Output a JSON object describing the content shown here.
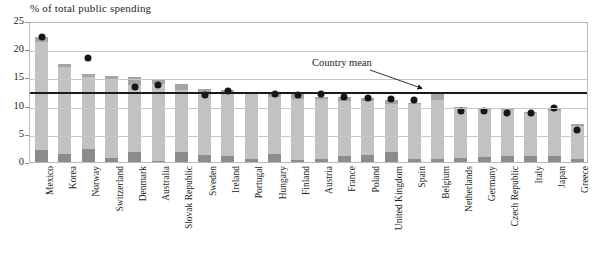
{
  "chart_data": {
    "type": "bar",
    "title": "% of total public spending",
    "xlabel": "",
    "ylabel": "% of total public spending",
    "ylim": [
      0,
      25
    ],
    "yticks": [
      0,
      5,
      10,
      15,
      20,
      25
    ],
    "grid": true,
    "legend_position": "none",
    "stacked": true,
    "categories": [
      "Mexico",
      "Korea",
      "Norway",
      "Switzerland",
      "Denmark",
      "Australia",
      "Slovak Republic",
      "Sweden",
      "Ireland",
      "Portugal",
      "Hungary",
      "Finland",
      "Austria",
      "France",
      "Poland",
      "United Kingdom",
      "Spain",
      "Belgium",
      "Netherlands",
      "Germany",
      "Czech Republic",
      "Italy",
      "Japan",
      "Greece"
    ],
    "series": [
      {
        "name": "lower segment",
        "values": [
          2.2,
          1.4,
          2.3,
          0.7,
          1.7,
          0.2,
          1.7,
          1.2,
          1.0,
          0.5,
          1.5,
          0.3,
          0.6,
          1.0,
          1.3,
          1.7,
          0.6,
          0.5,
          0.8,
          0.9,
          1.0,
          1.0,
          1.1,
          0.5
        ]
      },
      {
        "name": "middle segment",
        "values": [
          19.0,
          15.4,
          12.7,
          13.8,
          11.9,
          13.6,
          11.1,
          11.1,
          11.3,
          11.5,
          10.0,
          10.9,
          10.6,
          9.9,
          9.6,
          8.6,
          9.6,
          10.5,
          8.8,
          8.4,
          8.2,
          7.7,
          7.9,
          5.9
        ]
      },
      {
        "name": "upper segment",
        "values": [
          1.0,
          0.6,
          0.6,
          0.7,
          1.4,
          1.0,
          1.0,
          0.6,
          0.5,
          0.4,
          0.7,
          1.0,
          0.4,
          0.6,
          0.4,
          0.7,
          0.3,
          1.0,
          0.2,
          0.3,
          0.2,
          0.2,
          0.5,
          0.3
        ]
      }
    ],
    "totals": [
      22.2,
      17.4,
      15.6,
      15.2,
      15.0,
      14.8,
      13.8,
      12.9,
      12.8,
      12.4,
      12.2,
      12.2,
      11.6,
      11.5,
      11.3,
      11.0,
      10.5,
      12.0,
      9.8,
      9.6,
      9.4,
      8.9,
      9.5,
      6.7
    ],
    "markers": {
      "name": "country point",
      "values": [
        22.2,
        null,
        18.4,
        null,
        13.3,
        13.6,
        null,
        11.8,
        12.6,
        null,
        12.1,
        11.8,
        12.1,
        11.5,
        11.3,
        11.1,
        11.0,
        null,
        9.1,
        9.0,
        8.7,
        8.7,
        9.5,
        5.6
      ]
    },
    "reference_line": {
      "label": "Country mean",
      "value": 12.7
    }
  },
  "colors": {
    "segment_bottom": "#8c8c8c",
    "segment_middle": "#c2c2c2",
    "segment_top": "#a5a5a5",
    "marker": "#161616",
    "mean_line": "#1a1a1a",
    "gridline": "#c7c7c7",
    "frame": "#b9b9b9",
    "text": "#231f20"
  }
}
